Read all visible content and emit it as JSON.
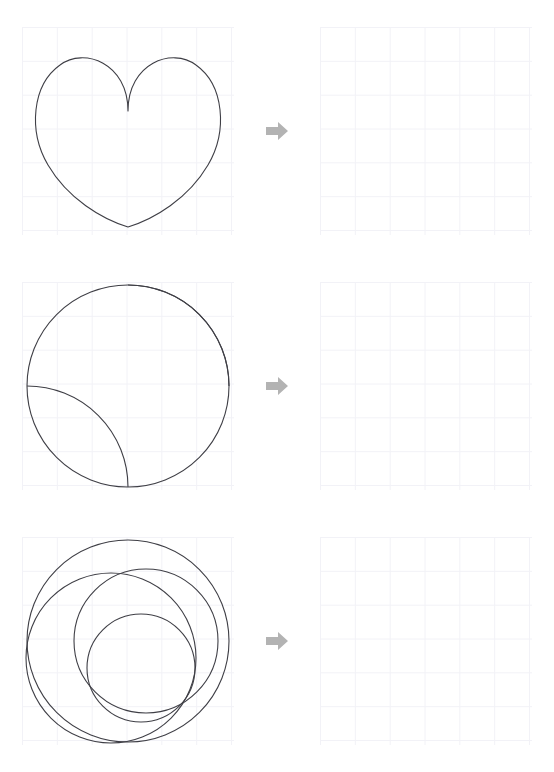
{
  "page": {
    "background_color": "#ffffff",
    "width": 554,
    "height": 772
  },
  "style": {
    "stroke_color": "#3f3f46",
    "stroke_width": 1,
    "grid_color": "#f2f2f7",
    "grid_border_color": "#eeeef3",
    "arrow_color": "#b3b3b3"
  },
  "grid": {
    "columns": 6,
    "rows": 6,
    "cell_size": 34.6
  },
  "arrow": {
    "icon": "arrow-right-icon",
    "label": "transforms to",
    "color": "#b3b3b3"
  },
  "rows": [
    {
      "index": 1,
      "source": {
        "shape_name": "heart",
        "description": "Heart outline formed by two top lobes meeting at a central cusp and a rounded bottom point",
        "filled": false
      },
      "target": {
        "shape_name": "empty-grid",
        "description": "Blank answer grid",
        "filled": false
      }
    },
    {
      "index": 2,
      "source": {
        "shape_name": "circle-with-two-quarter-arcs",
        "description": "Circle divided by two quarter-circle arcs, one from top-center to right-middle and one from left-middle to bottom-center",
        "filled": false
      },
      "target": {
        "shape_name": "empty-grid",
        "description": "Blank answer grid",
        "filled": false
      }
    },
    {
      "index": 3,
      "source": {
        "shape_name": "circle-with-spiral-pinwheel",
        "description": "Circle containing nested spiral arcs forming a two-armed pinwheel / yin-yang style swirl",
        "filled": false
      },
      "target": {
        "shape_name": "empty-grid",
        "description": "Blank answer grid",
        "filled": false
      }
    }
  ]
}
